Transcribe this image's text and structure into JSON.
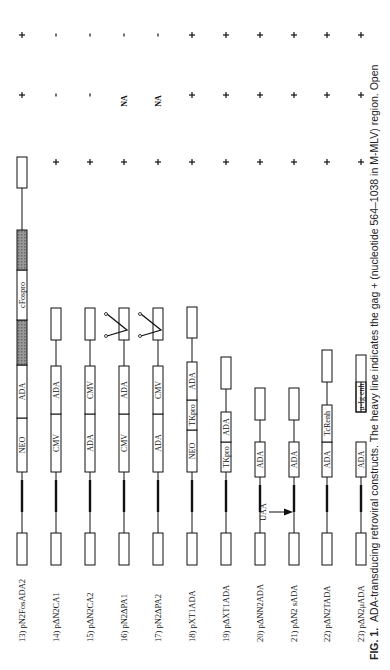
{
  "figure": {
    "caption_label": "FIG. 1.",
    "caption_text": "ADA-transducing retroviral constructs. The heavy line indicates the gag + (nucleotide 564–1038 in M-MLV) region. Open",
    "rotation": "90deg counterclockwise"
  },
  "constructs": [
    {
      "label": "13) pN2FosADA2",
      "segments": [
        "NEO",
        "ADA",
        "cFospro"
      ],
      "marks": [
        "+",
        "+",
        "+"
      ]
    },
    {
      "label": "14) pΔN2CA1",
      "segments": [
        "CMV",
        "ADA"
      ],
      "marks": [
        "+",
        "-",
        "-"
      ]
    },
    {
      "label": "15) pΔN2CA2",
      "segments": [
        "ADA",
        "CMV"
      ],
      "marks": [
        "+",
        "-",
        "-"
      ]
    },
    {
      "label": "16) pN2ΔPA1",
      "segments": [
        "CMV",
        "ADA"
      ],
      "marks": [
        "+",
        "NA",
        "-"
      ]
    },
    {
      "label": "17) pN2ΔPA2",
      "segments": [
        "ADA",
        "CMV"
      ],
      "marks": [
        "+",
        "NA",
        "-"
      ]
    },
    {
      "label": "18) pXT1ADA",
      "segments": [
        "NEO",
        "TKpro",
        "ADA"
      ],
      "marks": [
        "+",
        "+",
        "+"
      ]
    },
    {
      "label": "19) pΔXT1ADA",
      "segments": [
        "TKpro",
        "ADA"
      ],
      "marks": [
        "+",
        "+",
        "+"
      ]
    },
    {
      "label": "20) pΔNN2ADA",
      "segments": [
        "ADA"
      ],
      "marks": [
        "+",
        "+",
        "+"
      ],
      "annotation": "UAA"
    },
    {
      "label": "21) pΔN2 sADA",
      "segments": [
        "ADA"
      ],
      "marks": [
        "+",
        "+",
        "+"
      ]
    },
    {
      "label": "22) pΔN2TADA",
      "segments": [
        "ADA",
        "TcRenh"
      ],
      "marks": [
        "+",
        "+",
        "+"
      ]
    },
    {
      "label": "23) pΔN2μADA",
      "segments": [
        "ADA",
        "μ-Ig enh"
      ],
      "marks": [
        "+",
        "+",
        "+"
      ]
    }
  ],
  "colors": {
    "ink": "#111111",
    "hatch": "#8a8a8a",
    "background": "#ffffff"
  }
}
